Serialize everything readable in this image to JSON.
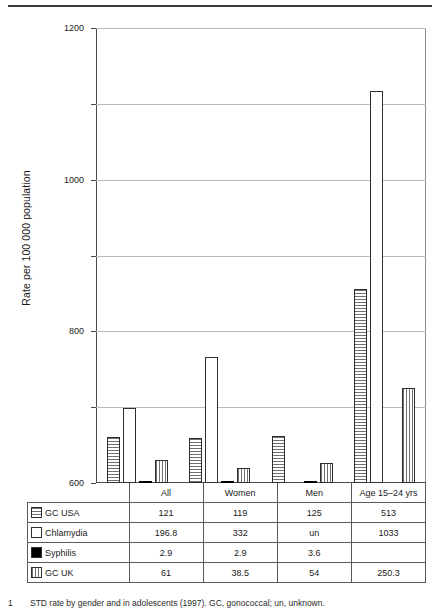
{
  "chart_data": {
    "type": "bar",
    "title": "",
    "xlabel": "",
    "ylabel": "Rate per 100 000 population",
    "ylim": [
      0,
      1200
    ],
    "yticks": [
      0,
      200,
      400,
      600,
      800,
      1000,
      1200
    ],
    "ytick_labels": [
      "0",
      "200",
      "400",
      "600",
      "800",
      "1000",
      "1200"
    ],
    "grid": true,
    "legend_position": "table-row-headers",
    "categories": [
      "All",
      "Women",
      "Men",
      "Age 15–24 yrs"
    ],
    "series": [
      {
        "name": "GC  USA",
        "pattern": "horizontal-lines",
        "values": [
          121,
          119,
          125,
          513
        ],
        "display_values": [
          "121",
          "119",
          "125",
          "513"
        ]
      },
      {
        "name": "Chlamydia",
        "pattern": "empty-white",
        "values": [
          196.8,
          332,
          null,
          1033
        ],
        "display_values": [
          "196.8",
          "332",
          "un",
          "1033"
        ]
      },
      {
        "name": "Syphilis",
        "pattern": "solid-black",
        "values": [
          2.9,
          2.9,
          3.6,
          null
        ],
        "display_values": [
          "2.9",
          "2.9",
          "3.6",
          ""
        ]
      },
      {
        "name": "GC  UK",
        "pattern": "vertical-lines",
        "values": [
          61,
          38.5,
          54,
          250.3
        ],
        "display_values": [
          "61",
          "38.5",
          "54",
          "250.3"
        ]
      }
    ]
  },
  "axis": {
    "y_title": "Rate per 100 000 population",
    "ticks": [
      {
        "label": "1200",
        "value": 1200
      },
      {
        "label": "1000",
        "value": 1000
      },
      {
        "label": "800",
        "value": 800
      },
      {
        "label": "600",
        "value": 600
      },
      {
        "label": "400",
        "value": 400
      },
      {
        "label": "200",
        "value": 200
      },
      {
        "label": "0",
        "value": 0
      }
    ]
  },
  "table": {
    "corner_label": "",
    "columns": [
      "All",
      "Women",
      "Men",
      "Age 15–24 yrs"
    ],
    "rows": [
      {
        "legend": "GC  USA",
        "swatch": "horizontal-lines-swatch",
        "cells": [
          "121",
          "119",
          "125",
          "513"
        ]
      },
      {
        "legend": "Chlamydia",
        "swatch": "empty-white-swatch",
        "cells": [
          "196.8",
          "332",
          "un",
          "1033"
        ]
      },
      {
        "legend": "Syphilis",
        "swatch": "solid-black-swatch",
        "cells": [
          "2.9",
          "2.9",
          "3.6",
          ""
        ]
      },
      {
        "legend": "GC  UK",
        "swatch": "vertical-lines-swatch",
        "cells": [
          "61",
          "38.5",
          "54",
          "250.3"
        ]
      }
    ]
  },
  "caption": {
    "number": "1",
    "text": "STD rate by gender and in adolescents (1997). GC, gonococcal; un, unknown."
  }
}
